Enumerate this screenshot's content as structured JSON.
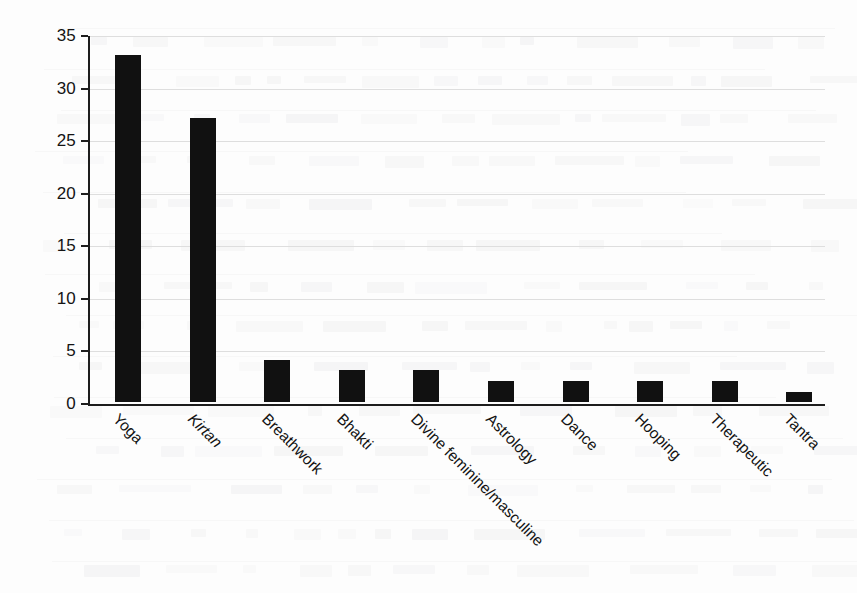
{
  "chart_data": {
    "type": "bar",
    "title": "",
    "subtitle": "",
    "xlabel": "",
    "ylabel": "Number of offerings",
    "categories": [
      "Yoga",
      "Kirtan",
      "Breathwork",
      "Bhakti",
      "Divine feminine/masculine",
      "Astrology",
      "Dance",
      "Hooping",
      "Therapeutic",
      "Tantra"
    ],
    "category_styles": [
      "normal",
      "italic",
      "normal",
      "normal",
      "normal",
      "normal",
      "normal",
      "normal",
      "normal",
      "normal"
    ],
    "values": [
      33,
      27,
      4,
      3,
      3,
      2,
      2,
      2,
      2,
      1
    ],
    "ylim": [
      0,
      35
    ],
    "ytick_values": [
      0,
      5,
      10,
      15,
      20,
      25,
      30,
      35
    ],
    "ytick_labels": [
      "0",
      "5",
      "10",
      "15",
      "20",
      "25",
      "30",
      "35"
    ],
    "grid": true,
    "grid_axis": "y",
    "legend": null,
    "legend_position": "none",
    "bar_color": "#111111",
    "axis_color": "#1d1d1d",
    "grid_color": "#dedede",
    "background_color": "#fdfdfd",
    "xlabel_rotation": 45
  }
}
